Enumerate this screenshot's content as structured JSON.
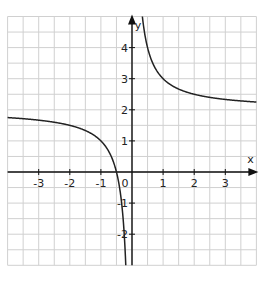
{
  "chart_data": {
    "type": "line",
    "title": "",
    "function": "y = 2 + 1/x",
    "xlabel": "x",
    "ylabel": "y",
    "xlim": [
      -4,
      4
    ],
    "ylim": [
      -3,
      5
    ],
    "grid": true,
    "grid_step": 0.5,
    "x_ticks": [
      "-3",
      "-2",
      "-1",
      "0",
      "1",
      "2",
      "3"
    ],
    "y_ticks": [
      "4",
      "3",
      "2",
      "1",
      "-1",
      "-2"
    ],
    "asymptotes": {
      "vertical": 0,
      "horizontal": 2
    },
    "series": [
      {
        "name": "left-branch",
        "x": [
          -4,
          -3,
          -2,
          -1,
          -0.5,
          -0.4,
          -0.3,
          -0.2
        ],
        "y": [
          1.75,
          1.67,
          1.5,
          1.0,
          0.0,
          -0.5,
          -1.33,
          -3.0
        ]
      },
      {
        "name": "right-branch",
        "x": [
          0.333,
          0.5,
          1,
          2,
          3,
          4
        ],
        "y": [
          5.0,
          4.0,
          3.0,
          2.5,
          2.33,
          2.25
        ]
      }
    ],
    "colors": {
      "grid": "#d0d0d0",
      "axis": "#111111",
      "curve": "#222222"
    }
  },
  "labels": {
    "x_axis": "x",
    "y_axis": "y",
    "origin": "0",
    "xt": [
      "-3",
      "-2",
      "-1",
      "1",
      "2",
      "3"
    ],
    "yt": [
      "4",
      "3",
      "2",
      "1",
      "-1",
      "-2"
    ]
  }
}
